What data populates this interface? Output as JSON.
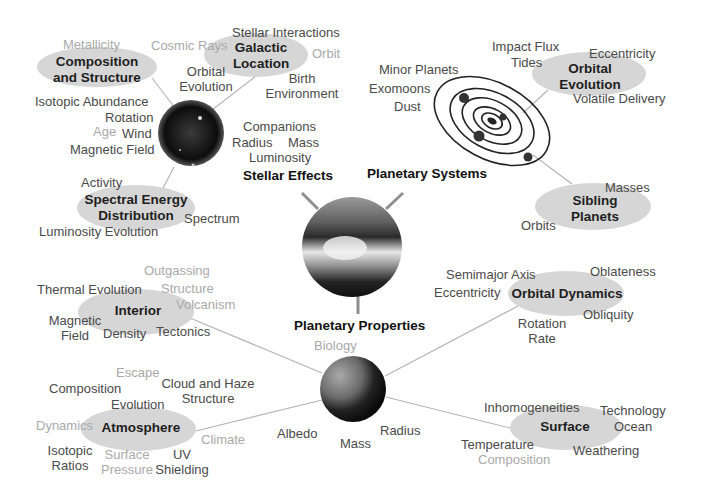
{
  "diagram": {
    "hubs": {
      "stellar_effects": "Stellar Effects",
      "planetary_systems": "Planetary Systems",
      "planetary_properties": "Planetary Properties"
    },
    "nodes": {
      "composition_structure": {
        "title_line1": "Composition",
        "title_line2": "and Structure",
        "terms": {
          "metallicity": "Metallicity",
          "isotopic_abundance": "Isotopic Abundance",
          "rotation": "Rotation",
          "age": "Age",
          "wind": "Wind",
          "magnetic_field": "Magnetic Field"
        }
      },
      "galactic_location": {
        "title_line1": "Galactic",
        "title_line2": "Location",
        "terms": {
          "stellar_interactions": "Stellar Interactions",
          "cosmic_rays": "Cosmic Rays",
          "orbit": "Orbit",
          "orbital_evolution_1": "Orbital",
          "orbital_evolution_2": "Evolution",
          "birth_1": "Birth",
          "birth_2": "Environment"
        }
      },
      "stellar_props": {
        "companions": "Companions",
        "radius": "Radius",
        "mass": "Mass",
        "luminosity": "Luminosity"
      },
      "spectral_energy": {
        "title_line1": "Spectral Energy",
        "title_line2": "Distribution",
        "terms": {
          "activity": "Activity",
          "spectrum": "Spectrum",
          "luminosity_evolution": "Luminosity Evolution"
        }
      },
      "planetary_system_terms": {
        "minor_planets": "Minor Planets",
        "exomoons": "Exomoons",
        "dust": "Dust"
      },
      "orbital_evolution": {
        "title_line1": "Orbital",
        "title_line2": "Evolution",
        "terms": {
          "impact_flux": "Impact Flux",
          "tides": "Tides",
          "eccentricity": "Eccentricity",
          "volatile_delivery": "Volatile Delivery"
        }
      },
      "sibling_planets": {
        "title_line1": "Sibling",
        "title_line2": "Planets",
        "terms": {
          "masses": "Masses",
          "orbits": "Orbits"
        }
      },
      "interior": {
        "title": "Interior",
        "terms": {
          "outgassing": "Outgassing",
          "thermal_evolution": "Thermal Evolution",
          "structure": "Structure",
          "volcanism": "Volcanism",
          "magnetic_1": "Magnetic",
          "magnetic_2": "Field",
          "density": "Density",
          "tectonics": "Tectonics"
        }
      },
      "planet_core_terms": {
        "biology": "Biology",
        "albedo": "Albedo",
        "mass": "Mass",
        "radius": "Radius"
      },
      "atmosphere": {
        "title": "Atmosphere",
        "terms": {
          "escape": "Escape",
          "composition": "Composition",
          "cloud_haze_1": "Cloud and Haze",
          "cloud_haze_2": "Structure",
          "evolution": "Evolution",
          "dynamics": "Dynamics",
          "climate": "Climate",
          "isotopic_1": "Isotopic",
          "isotopic_2": "Ratios",
          "surface_pressure_1": "Surface",
          "surface_pressure_2": "Pressure",
          "uv_1": "UV",
          "uv_2": "Shielding"
        }
      },
      "orbital_dynamics": {
        "title": "Orbital Dynamics",
        "terms": {
          "semimajor_axis": "Semimajor Axis",
          "oblateness": "Oblateness",
          "eccentricity": "Eccentricity",
          "obliquity": "Obliquity",
          "rotation_1": "Rotation",
          "rotation_2": "Rate"
        }
      },
      "surface": {
        "title": "Surface",
        "terms": {
          "inhomogeneities": "Inhomogeneities",
          "technology": "Technology",
          "ocean": "Ocean",
          "temperature": "Temperature",
          "weathering": "Weathering",
          "composition": "Composition"
        }
      }
    },
    "colors": {
      "ellipse": "#d6d6d6",
      "connector": "#b5b5b5",
      "dark_text": "#4a4a4a",
      "light_text": "#a9a9a9"
    }
  }
}
